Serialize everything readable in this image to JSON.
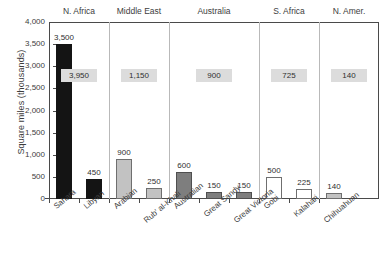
{
  "chart_data": {
    "type": "bar",
    "title": "",
    "xlabel": "",
    "ylabel": "Square miles (thousands)",
    "ylim": [
      0,
      4000
    ],
    "ytick_step": 500,
    "grid": false,
    "legend": "none",
    "yticks": [
      "4,000",
      "3,500",
      "3,000",
      "2,500",
      "2,000",
      "1,500",
      "1,000",
      "500",
      "0"
    ],
    "ytick_values": [
      4000,
      3500,
      3000,
      2500,
      2000,
      1500,
      1000,
      500,
      0
    ],
    "categories": [
      "Sahara",
      "Libyan",
      "Arabian",
      "Rub' al-Khali",
      "Australian",
      "Great Sandy",
      "Great Victoria",
      "Gobi",
      "Kalahari",
      "Chihuahuan"
    ],
    "values": [
      3500,
      450,
      900,
      250,
      600,
      150,
      150,
      500,
      225,
      140
    ],
    "bar_labels": [
      "3,500",
      "450",
      "900",
      "250",
      "600",
      "150",
      "150",
      "500",
      "225",
      "140"
    ],
    "bar_fills": [
      "black",
      "black",
      "ltgray",
      "ltgray",
      "dkgray",
      "dkgray",
      "dkgray",
      "white",
      "white",
      "ltgray"
    ],
    "groups": [
      {
        "name": "N. Africa",
        "total": "3,950",
        "total_value": 3950,
        "members": [
          "Sahara",
          "Libyan"
        ]
      },
      {
        "name": "Middle East",
        "total": "1,150",
        "total_value": 1150,
        "members": [
          "Arabian",
          "Rub' al-Khali"
        ]
      },
      {
        "name": "Australia",
        "total": "900",
        "total_value": 900,
        "members": [
          "Australian",
          "Great Sandy",
          "Great Victoria"
        ]
      },
      {
        "name": "S. Africa",
        "total": "725",
        "total_value": 725,
        "members": [
          "Gobi",
          "Kalahari"
        ]
      },
      {
        "name": "N. Amer.",
        "total": "140",
        "total_value": 140,
        "members": [
          "Chihuahuan"
        ]
      }
    ],
    "colors": {
      "black": "#141414",
      "light_gray": "#c2c2c2",
      "dark_gray": "#7e7e7e",
      "white": "#ffffff",
      "total_box": "#dcdcdc",
      "axis": "#4a4a4a",
      "divider": "#b9b9b9",
      "text": "#3d3d3d"
    }
  }
}
